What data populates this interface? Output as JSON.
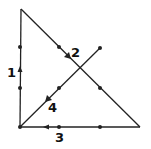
{
  "diagram": {
    "type": "graph-path",
    "colors": {
      "line": "#222222",
      "background": "#ffffff"
    },
    "vertices": {
      "top": [
        21,
        9
      ],
      "bottom_left": [
        20,
        127
      ],
      "bottom_right": [
        140,
        127
      ],
      "diag_end": [
        100,
        48
      ]
    },
    "edges": [
      {
        "id": "1",
        "label": "1",
        "from": "bottom_left",
        "to": "top",
        "direction": "up",
        "label_pos": [
          11,
          77
        ]
      },
      {
        "id": "2",
        "label": "2",
        "from": "top",
        "to": "bottom_right",
        "direction": "down-right",
        "label_pos": [
          71,
          57
        ]
      },
      {
        "id": "3",
        "label": "3",
        "from": "bottom_right",
        "to": "bottom_left",
        "direction": "left",
        "label_pos": [
          55,
          142
        ]
      },
      {
        "id": "4",
        "label": "4",
        "from": "diag_end",
        "to": "bottom_left",
        "direction": "down-left",
        "label_pos": [
          48,
          112
        ]
      }
    ],
    "dots": [
      [
        20,
        47
      ],
      [
        20,
        88
      ],
      [
        59,
        47
      ],
      [
        100,
        88
      ],
      [
        59,
        127
      ],
      [
        100,
        127
      ],
      [
        59,
        88
      ],
      [
        100,
        48
      ],
      [
        20,
        127
      ]
    ]
  }
}
